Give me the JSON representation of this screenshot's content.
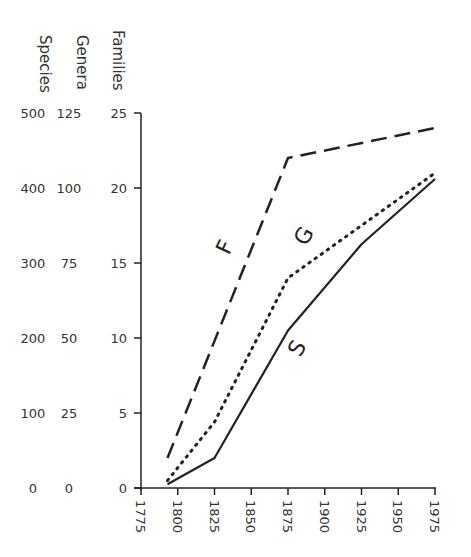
{
  "chart_data": {
    "type": "line",
    "title": "",
    "xlabel": "",
    "xlim": [
      1775,
      1975
    ],
    "x_ticks": [
      "1775",
      "1800",
      "1825",
      "1850",
      "1875",
      "1900",
      "1925",
      "1950",
      "1975"
    ],
    "y_axes": [
      {
        "name": "Species",
        "ticks": [
          "0",
          "100",
          "200",
          "300",
          "400",
          "500"
        ],
        "ylim": [
          0,
          500
        ]
      },
      {
        "name": "Genera",
        "ticks": [
          "0",
          "25",
          "50",
          "75",
          "100",
          "125"
        ],
        "ylim": [
          0,
          125
        ]
      },
      {
        "name": "Families",
        "ticks": [
          "0",
          "5",
          "10",
          "15",
          "20",
          "25"
        ],
        "ylim": [
          0,
          25
        ]
      }
    ],
    "series": [
      {
        "name": "F",
        "label": "F",
        "axis": "Families",
        "style": "dashed",
        "x": [
          1793,
          1875,
          1975
        ],
        "values": [
          2,
          22,
          24
        ]
      },
      {
        "name": "G",
        "label": "G",
        "axis": "Genera",
        "style": "dotted",
        "x": [
          1793,
          1825,
          1875,
          1975
        ],
        "values": [
          2.5,
          22,
          70,
          105
        ]
      },
      {
        "name": "S",
        "label": "S",
        "axis": "Species",
        "style": "solid",
        "x": [
          1793,
          1825,
          1875,
          1925,
          1975
        ],
        "values": [
          5,
          40,
          210,
          325,
          412
        ]
      }
    ],
    "grid": false,
    "legend": "inline labels on lines"
  }
}
